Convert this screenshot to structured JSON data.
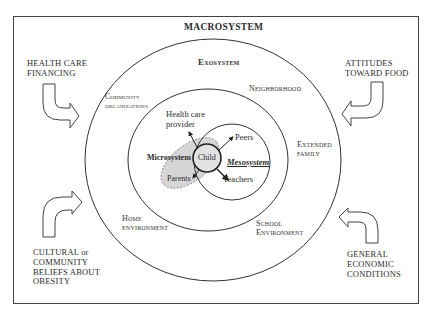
{
  "diagram": {
    "title": "MACROSYSTEM",
    "type": "nested ecological systems model",
    "systems": {
      "macrosystem": "MACROSYSTEM",
      "exosystem": "Exosystem",
      "microsystem": "Microsystem",
      "mesosystem": "Mesosystem"
    },
    "exosystem_labels": {
      "community_organizations_line1": "Community",
      "community_organizations_line2": "organizations",
      "neighborhood": "Neighborhood",
      "extended_family_line1": "Extended",
      "extended_family_line2": "family",
      "home_environment_line1": "Home",
      "home_environment_line2": "environment",
      "school_environment_line1": "School",
      "school_environment_line2": "Environment"
    },
    "center": {
      "child": "Child",
      "health_care_provider_line1": "Health care",
      "health_care_provider_line2": "provider",
      "peers": "Peers",
      "teachers": "Teachers",
      "parents": "Parents"
    },
    "macro_factors": {
      "top_left": {
        "line1": "HEALTH CARE",
        "line2": "FINANCING"
      },
      "top_right": {
        "line1": "ATTITUDES",
        "line2": "TOWARD FOOD"
      },
      "bottom_left": {
        "line1": "CULTURAL or",
        "line2": "COMMUNITY",
        "line3": "BELIEFS ABOUT",
        "line4": "OBESITY"
      },
      "bottom_right": {
        "line1": "GENERAL",
        "line2": "ECONOMIC",
        "line3": "CONDITIONS"
      }
    },
    "colors": {
      "line": "#333333",
      "microsystem_fill": "#d6d6d6",
      "child_fill": "#e2e2e2",
      "background": "#ffffff"
    }
  }
}
